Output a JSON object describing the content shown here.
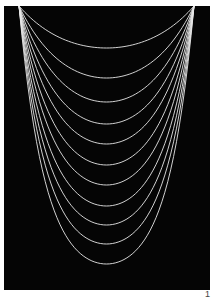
{
  "figure": {
    "background_color": "#050505",
    "curve_color": "#e8e8e8",
    "anchor_left": [
      19,
      6
    ],
    "anchor_right": [
      194,
      6
    ],
    "curve_bottoms_y": [
      48,
      78,
      102,
      124,
      144,
      165,
      185,
      206,
      225,
      244,
      264
    ],
    "curve_count": 11
  },
  "page_number": "1"
}
